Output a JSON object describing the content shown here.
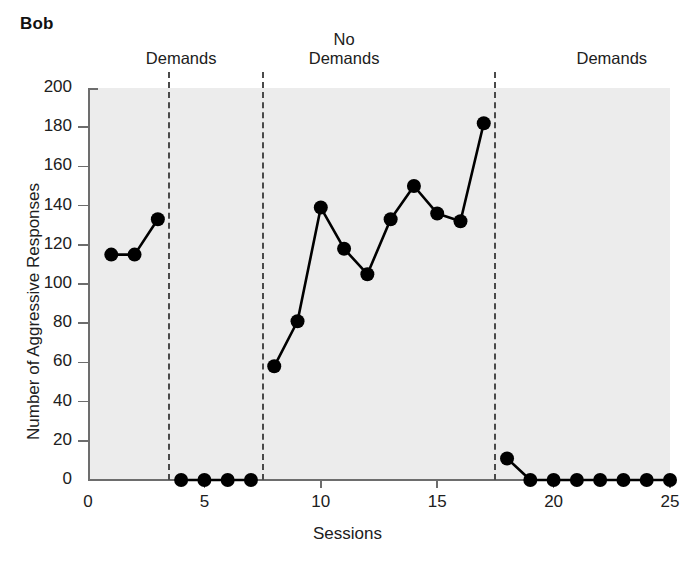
{
  "title": "Bob",
  "phase_labels": [
    {
      "text": "Demands",
      "center_x": 4.0,
      "two_line": false
    },
    {
      "text": "No\nDemands",
      "center_x": 11.0,
      "two_line": true
    },
    {
      "text": "Demands",
      "center_x": 22.5,
      "two_line": false
    },
    {
      "text": "No Demands",
      "center_x": 34.5,
      "two_line": false
    }
  ],
  "axes": {
    "xlabel": "Sessions",
    "ylabel": "Number of Aggressive Responses",
    "yticks": [
      0,
      20,
      40,
      60,
      80,
      100,
      120,
      140,
      160,
      180,
      200
    ],
    "xticks": [
      0,
      5,
      10,
      15,
      20,
      25
    ],
    "xlim": [
      0,
      25
    ],
    "ylim": [
      0,
      200
    ]
  },
  "colors": {
    "plot_background": "#ececec",
    "axis": "#6d6d6d",
    "marker": "#000000",
    "divider": "#4a4a4a",
    "text": "#202020"
  },
  "chart_data": {
    "type": "line",
    "title": "Bob",
    "xlabel": "Sessions",
    "ylabel": "Number of Aggressive Responses",
    "xlim": [
      0,
      25
    ],
    "ylim": [
      0,
      200
    ],
    "grid": false,
    "legend": "none",
    "phase_change_lines": [
      3.5,
      7.5,
      17.5
    ],
    "annotations": [
      "Demands",
      "No Demands",
      "Demands",
      "No Demands"
    ],
    "series": [
      {
        "name": "Demands (baseline)",
        "phase": "Demands",
        "x": [
          1,
          2,
          3
        ],
        "values": [
          115,
          115,
          133
        ]
      },
      {
        "name": "No Demands",
        "phase": "No Demands",
        "x": [
          4,
          5,
          6,
          7
        ],
        "values": [
          0,
          0,
          0,
          0
        ]
      },
      {
        "name": "Demands (return)",
        "phase": "Demands",
        "x": [
          8,
          9,
          10,
          11,
          12,
          13,
          14,
          15,
          16,
          17
        ],
        "values": [
          58,
          81,
          139,
          118,
          105,
          133,
          150,
          136,
          132,
          182
        ]
      },
      {
        "name": "No Demands (return)",
        "phase": "No Demands",
        "x": [
          18,
          19,
          20,
          21,
          22,
          23,
          24,
          25
        ],
        "values": [
          11,
          0,
          0,
          0,
          0,
          0,
          0,
          0
        ]
      }
    ]
  }
}
